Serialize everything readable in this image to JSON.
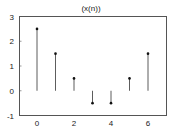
{
  "chart_data": {
    "type": "stem",
    "title": "(x(n))",
    "xlabel": "",
    "ylabel": "",
    "x": [
      0,
      1,
      2,
      3,
      4,
      5,
      6
    ],
    "values": [
      2.5,
      1.5,
      0.5,
      -0.5,
      -0.5,
      0.5,
      1.5
    ],
    "xticks": [
      0,
      2,
      4,
      6
    ],
    "yticks": [
      -1,
      0,
      1,
      2,
      3
    ],
    "xlim": [
      -1,
      7
    ],
    "ylim": [
      -1,
      3
    ],
    "grid": false,
    "legend": null,
    "colors": {
      "stem": "#333333",
      "marker": "#111111",
      "frame": "#555555"
    }
  }
}
